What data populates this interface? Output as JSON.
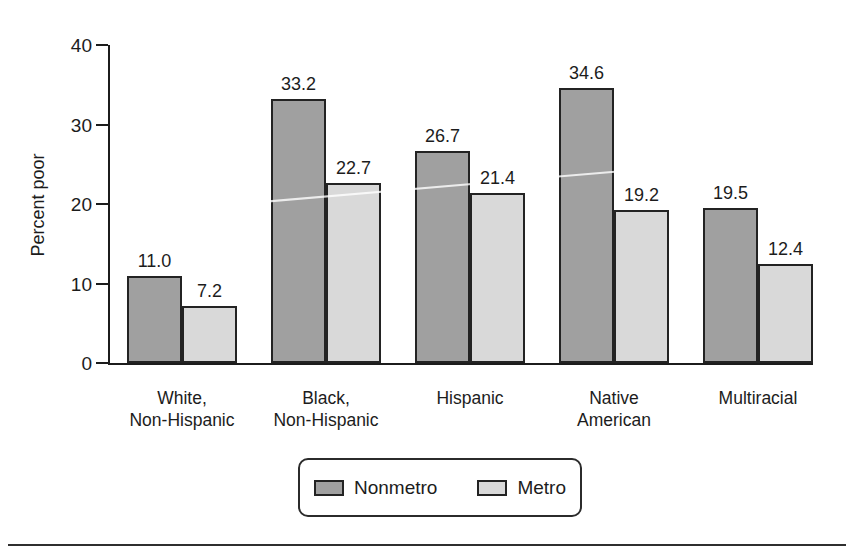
{
  "chart_data": {
    "type": "bar",
    "title": "",
    "xlabel": "",
    "ylabel": "Percent poor",
    "ylim": [
      0,
      40
    ],
    "yticks": [
      0,
      10,
      20,
      30,
      40
    ],
    "grid": false,
    "legend_position": "bottom",
    "categories": [
      "White, Non-Hispanic",
      "Black, Non-Hispanic",
      "Hispanic",
      "Native American",
      "Multiracial"
    ],
    "category_lines": [
      [
        "White,",
        "Non-Hispanic"
      ],
      [
        "Black,",
        "Non-Hispanic"
      ],
      [
        "Hispanic"
      ],
      [
        "Native",
        "American"
      ],
      [
        "Multiracial"
      ]
    ],
    "series": [
      {
        "name": "Nonmetro",
        "color": "#a0a0a0",
        "values": [
          11.0,
          33.2,
          26.7,
          34.6,
          19.5
        ]
      },
      {
        "name": "Metro",
        "color": "#d9d9d9",
        "values": [
          7.2,
          22.7,
          21.4,
          19.2,
          12.4
        ]
      }
    ],
    "bar_edge_color": "#232323",
    "axis_color": "#1c1c1c",
    "value_label_format": "one-decimal"
  }
}
